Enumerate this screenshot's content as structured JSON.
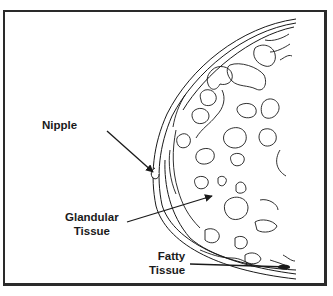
{
  "diagram": {
    "labels": {
      "nipple": "Nipple",
      "glandular_line1": "Glandular",
      "glandular_line2": "Tissue",
      "fatty_line1": "Fatty",
      "fatty_line2": "Tissue"
    },
    "colors": {
      "ink": "#1a1a1a",
      "background": "#ffffff",
      "frame": "#2a2a2a"
    }
  }
}
